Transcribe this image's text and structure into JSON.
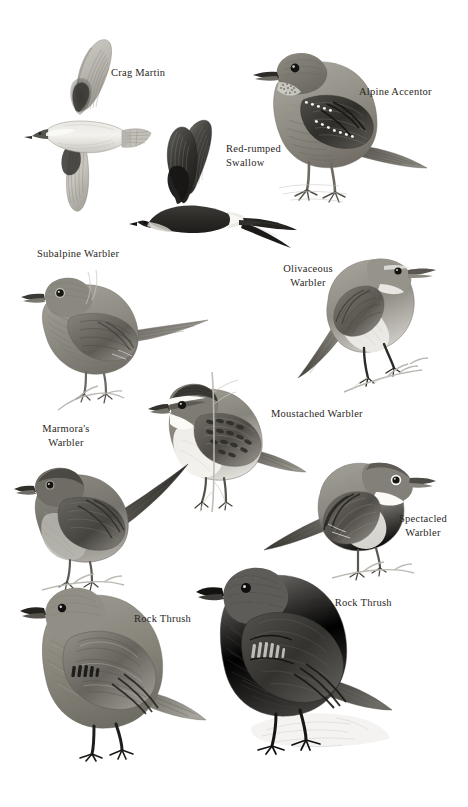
{
  "plate": {
    "kind": "field-guide-plate",
    "page_background": "#ffffff",
    "ink_color": "#2b2724",
    "width": 468,
    "height": 807,
    "palette": {
      "ink": "#2b2724",
      "dark": "#3a3a38",
      "mid_dark": "#5e5c58",
      "mid": "#8d8b85",
      "light": "#b9b7b0",
      "pale": "#d9d7d1",
      "near_white": "#f0efeb",
      "white": "#ffffff"
    }
  },
  "labels": [
    {
      "id": "crag-martin",
      "text": "Crag Martin",
      "x": 111,
      "y": 66,
      "align": "left",
      "lines": 1
    },
    {
      "id": "alpine-accentor",
      "text": "Alpine Accentor",
      "x": 359,
      "y": 85,
      "align": "left",
      "lines": 1
    },
    {
      "id": "red-rumped-swallow",
      "text": "Red-rumped\nSwallow",
      "x": 226,
      "y": 142,
      "align": "left",
      "lines": 2
    },
    {
      "id": "subalpine-warbler",
      "text": "Subalpine Warbler",
      "x": 37,
      "y": 247,
      "align": "left",
      "lines": 1
    },
    {
      "id": "olivaceous-warbler",
      "text": "Olivaceous\nWarbler",
      "x": 274,
      "y": 262,
      "align": "center",
      "lines": 2
    },
    {
      "id": "marmoras-warbler",
      "text": "Marmora's\nWarbler",
      "x": 30,
      "y": 422,
      "align": "center",
      "lines": 2
    },
    {
      "id": "moustached-warbler",
      "text": "Moustached Warbler",
      "x": 271,
      "y": 407,
      "align": "left",
      "lines": 1
    },
    {
      "id": "spectacled-warbler",
      "text": "Spectacled\nWarbler",
      "x": 388,
      "y": 512,
      "align": "center",
      "lines": 2
    },
    {
      "id": "rock-thrush",
      "text": "Rock Thrush",
      "x": 134,
      "y": 612,
      "align": "left",
      "lines": 1
    },
    {
      "id": "blue-rock-thrush",
      "text": "Blue Rock Thrush",
      "x": 311,
      "y": 596,
      "align": "left",
      "lines": 1
    }
  ],
  "birds": [
    {
      "id": "crag-martin",
      "common_name": "Crag Martin",
      "pose": "in flight, seen from below, wings spread, short square tail",
      "plumage": "pale grey-brown underparts, dark underwing coverts, pale throat",
      "x": 18,
      "y": 33,
      "w": 136,
      "h": 190
    },
    {
      "id": "red-rumped-swallow",
      "common_name": "Red-rumped Swallow",
      "pose": "in flight from side, long deeply forked tail streamers",
      "plumage": "dark glossy upperparts, pale rump band, pale underparts",
      "x": 135,
      "y": 118,
      "w": 165,
      "h": 130
    },
    {
      "id": "alpine-accentor",
      "common_name": "Alpine Accentor",
      "pose": "standing on ground, side-on, facing left",
      "plumage": "streaked grey-brown, spotted wing-bars, chestnut flank streaks, speckled throat",
      "x": 243,
      "y": 38,
      "w": 188,
      "h": 175
    },
    {
      "id": "subalpine-warbler",
      "common_name": "Subalpine Warbler",
      "pose": "perched on twig, side-on, facing left, long tail cocked",
      "plumage": "plain grey-brown above, paler below",
      "x": 18,
      "y": 262,
      "w": 200,
      "h": 150
    },
    {
      "id": "olivaceous-warbler",
      "common_name": "Olivaceous Warbler",
      "pose": "perched on twig, side-on, facing right",
      "plumage": "plain grey-olive above, whitish below, pale supercilium",
      "x": 288,
      "y": 240,
      "w": 150,
      "h": 160
    },
    {
      "id": "moustached-warbler",
      "common_name": "Moustached Warbler",
      "pose": "perched gripping vertical reed stem, facing left",
      "plumage": "bold white supercilium, dark crown, streaked mantle, white throat",
      "x": 148,
      "y": 372,
      "w": 160,
      "h": 140
    },
    {
      "id": "marmoras-warbler",
      "common_name": "Marmora's Warbler",
      "pose": "perched on twig, side-on, facing left, long dark tail",
      "plumage": "uniform slate-grey, paler belly",
      "x": 12,
      "y": 452,
      "w": 190,
      "h": 140
    },
    {
      "id": "spectacled-warbler",
      "common_name": "Spectacled Warbler",
      "pose": "perched on twig, side-on, facing right, tail to the left",
      "plumage": "grey head, rufous wing panel, white throat",
      "x": 262,
      "y": 450,
      "w": 175,
      "h": 130
    },
    {
      "id": "rock-thrush",
      "common_name": "Rock Thrush",
      "pose": "standing, side-on, facing left, short tail",
      "plumage": "mottled grey-brown, scaly scapulars, pale wing markings",
      "x": 20,
      "y": 578,
      "w": 190,
      "h": 185
    },
    {
      "id": "blue-rock-thrush",
      "common_name": "Blue Rock Thrush",
      "pose": "standing on rock, side-on, facing left",
      "plumage": "dark slate-blue overall, darker wings with pale streaking",
      "x": 196,
      "y": 558,
      "w": 200,
      "h": 205
    }
  ]
}
